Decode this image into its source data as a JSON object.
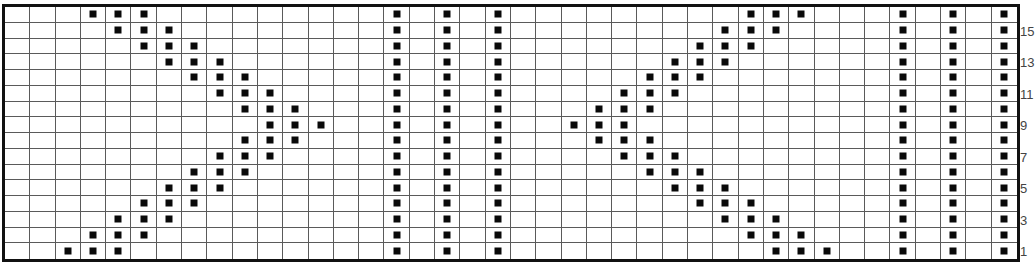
{
  "chart": {
    "title": "",
    "columns": 40,
    "rows": 16,
    "cell_width": 25.3,
    "cell_height": 15.75,
    "colors": {
      "background": "#ffffff",
      "grid_line": "#5a5a5a",
      "border": "#111111",
      "stitch": "#0a0a0a",
      "label": "#444444"
    },
    "symbol_legend": {
      "filled-square": "marked stitch"
    },
    "row_labels": [
      {
        "row": 15,
        "text": "15"
      },
      {
        "row": 13,
        "text": "13"
      },
      {
        "row": 11,
        "text": "11"
      },
      {
        "row": 9,
        "text": "9"
      },
      {
        "row": 7,
        "text": "7"
      },
      {
        "row": 5,
        "text": "5"
      },
      {
        "row": 3,
        "text": "3"
      },
      {
        "row": 1,
        "text": "1"
      }
    ],
    "marked_cells_by_row": {
      "16": [
        4,
        5,
        6,
        16,
        18,
        20,
        30,
        31,
        32,
        36,
        38,
        40
      ],
      "15": [
        5,
        6,
        7,
        16,
        18,
        20,
        29,
        30,
        31,
        36,
        38,
        40
      ],
      "14": [
        6,
        7,
        8,
        16,
        18,
        20,
        28,
        29,
        30,
        36,
        38,
        40
      ],
      "13": [
        7,
        8,
        9,
        16,
        18,
        20,
        27,
        28,
        29,
        36,
        38,
        40
      ],
      "12": [
        8,
        9,
        10,
        16,
        18,
        20,
        26,
        27,
        28,
        36,
        38,
        40
      ],
      "11": [
        9,
        10,
        11,
        16,
        18,
        20,
        25,
        26,
        27,
        36,
        38,
        40
      ],
      "10": [
        10,
        11,
        12,
        16,
        18,
        20,
        24,
        25,
        26,
        36,
        38,
        40
      ],
      "9": [
        11,
        12,
        13,
        16,
        18,
        20,
        23,
        24,
        25,
        36,
        38,
        40
      ],
      "8": [
        10,
        11,
        12,
        16,
        18,
        20,
        24,
        25,
        26,
        36,
        38,
        40
      ],
      "7": [
        9,
        10,
        11,
        16,
        18,
        20,
        25,
        26,
        27,
        36,
        38,
        40
      ],
      "6": [
        8,
        9,
        10,
        16,
        18,
        20,
        26,
        27,
        28,
        36,
        38,
        40
      ],
      "5": [
        7,
        8,
        9,
        16,
        18,
        20,
        27,
        28,
        29,
        36,
        38,
        40
      ],
      "4": [
        6,
        7,
        8,
        16,
        18,
        20,
        28,
        29,
        30,
        36,
        38,
        40
      ],
      "3": [
        5,
        6,
        7,
        16,
        18,
        20,
        29,
        30,
        31,
        36,
        38,
        40
      ],
      "2": [
        4,
        5,
        6,
        16,
        18,
        20,
        30,
        31,
        32,
        36,
        38,
        40
      ],
      "1": [
        3,
        4,
        5,
        16,
        18,
        20,
        31,
        32,
        33,
        36,
        38,
        40
      ]
    }
  }
}
